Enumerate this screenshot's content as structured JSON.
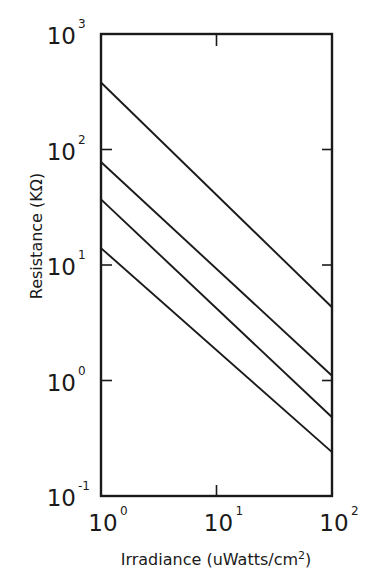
{
  "chart_data": {
    "type": "line",
    "title": "",
    "xlabel": "Irradiance (uWatts/cm2)",
    "ylabel": "Resistance (KΩ)",
    "xscale": "log",
    "yscale": "log",
    "xlim": [
      1,
      100
    ],
    "ylim": [
      0.1,
      1000
    ],
    "grid": false,
    "legend": null,
    "x_ticks": [
      {
        "base": "10",
        "exp": "0",
        "value": 1
      },
      {
        "base": "10",
        "exp": "1",
        "value": 10
      },
      {
        "base": "10",
        "exp": "2",
        "value": 100
      }
    ],
    "y_ticks": [
      {
        "base": "10",
        "exp": "3",
        "value": 1000
      },
      {
        "base": "10",
        "exp": "2",
        "value": 100
      },
      {
        "base": "10",
        "exp": "1",
        "value": 10
      },
      {
        "base": "10",
        "exp": "0",
        "value": 1
      },
      {
        "base": "10",
        "exp": "-1",
        "value": 0.1
      }
    ],
    "x": [
      1,
      100
    ],
    "series": [
      {
        "name": "curve-1",
        "values": [
          380,
          4.3
        ]
      },
      {
        "name": "curve-2",
        "values": [
          78,
          1.1
        ]
      },
      {
        "name": "curve-3",
        "values": [
          37,
          0.48
        ]
      },
      {
        "name": "curve-4",
        "values": [
          14,
          0.24
        ]
      }
    ]
  },
  "labels": {
    "xlabel_main": "Irradiance (uWatts/cm",
    "xlabel_sup": "2",
    "xlabel_close": ")",
    "ylabel": "Resistance (KΩ)"
  },
  "colors": {
    "ink": "#1a1a1a",
    "background": "#ffffff"
  }
}
